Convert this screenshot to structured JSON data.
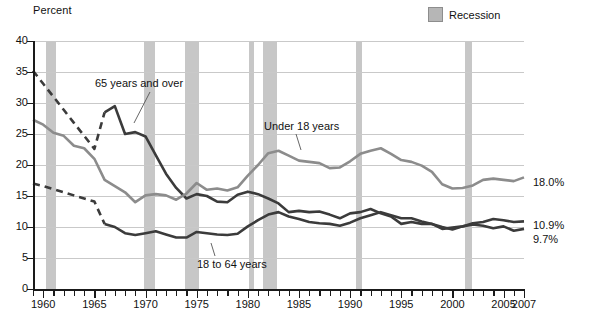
{
  "axis_title": "Percent",
  "legend": {
    "label": "Recession",
    "swatch_color": "#b6b6b6"
  },
  "right_labels": [
    {
      "text": "18.0%",
      "series": "Under 18 years"
    },
    {
      "text": "10.9%",
      "series": "18 to 64 years"
    },
    {
      "text": "9.7%",
      "series": "65 years and over"
    }
  ],
  "annotations": [
    {
      "text": "65 years and over"
    },
    {
      "text": "Under 18 years"
    },
    {
      "text": "18 to 64 years"
    }
  ],
  "source_note": "",
  "chart_data": {
    "type": "line",
    "title": "",
    "xlabel": "",
    "ylabel": "Percent",
    "xlim": [
      1959,
      2007
    ],
    "ylim": [
      0,
      40
    ],
    "ytick_values": [
      0,
      5,
      10,
      15,
      20,
      25,
      30,
      35,
      40
    ],
    "ytick_labels": [
      "0",
      "5",
      "10",
      "15",
      "20",
      "25",
      "30",
      "35",
      "40"
    ],
    "xtick_major_values": [
      1960,
      1965,
      1970,
      1975,
      1980,
      1985,
      1990,
      1995,
      2000,
      2005,
      2007
    ],
    "xtick_major_labels": [
      "1960",
      "1965",
      "1970",
      "1975",
      "1980",
      "1985",
      "1990",
      "1995",
      "2000",
      "2005",
      "2007"
    ],
    "xtick_minor_step": 1,
    "grid": "horizontal",
    "legend_position": "top-right",
    "recession_bands": [
      {
        "start": 1960.3,
        "end": 1961.2
      },
      {
        "start": 1969.9,
        "end": 1970.9
      },
      {
        "start": 1973.9,
        "end": 1975.2
      },
      {
        "start": 1980.1,
        "end": 1980.6
      },
      {
        "start": 1981.5,
        "end": 1982.9
      },
      {
        "start": 1990.6,
        "end": 1991.2
      },
      {
        "start": 2001.2,
        "end": 2001.9
      }
    ],
    "series": [
      {
        "name": "65 years and over",
        "color": "#3b3b3b",
        "width": 2.6,
        "dashed_until": 1966,
        "x": [
          1959,
          1960,
          1961,
          1962,
          1963,
          1964,
          1965,
          1966,
          1967,
          1968,
          1969,
          1970,
          1971,
          1972,
          1973,
          1974,
          1975,
          1976,
          1977,
          1978,
          1979,
          1980,
          1981,
          1982,
          1983,
          1984,
          1985,
          1986,
          1987,
          1988,
          1989,
          1990,
          1991,
          1992,
          1993,
          1994,
          1995,
          1996,
          1997,
          1998,
          1999,
          2000,
          2001,
          2002,
          2003,
          2004,
          2005,
          2006,
          2007
        ],
        "y": [
          35.2,
          33.1,
          31.0,
          28.9,
          26.8,
          24.7,
          22.6,
          28.5,
          29.5,
          25.0,
          25.3,
          24.6,
          21.6,
          18.6,
          16.3,
          14.6,
          15.3,
          15.0,
          14.1,
          14.0,
          15.2,
          15.7,
          15.3,
          14.6,
          13.8,
          12.4,
          12.6,
          12.4,
          12.5,
          12.0,
          11.4,
          12.2,
          12.4,
          12.9,
          12.2,
          11.7,
          10.5,
          10.8,
          10.5,
          10.5,
          9.7,
          9.9,
          10.1,
          10.4,
          10.2,
          9.8,
          10.1,
          9.4,
          9.7
        ]
      },
      {
        "name": "18 to 64 years",
        "color": "#3b3b3b",
        "width": 2.6,
        "dashed_until": 1966,
        "x": [
          1959,
          1960,
          1961,
          1962,
          1963,
          1964,
          1965,
          1966,
          1967,
          1968,
          1969,
          1970,
          1971,
          1972,
          1973,
          1974,
          1975,
          1976,
          1977,
          1978,
          1979,
          1980,
          1981,
          1982,
          1983,
          1984,
          1985,
          1986,
          1987,
          1988,
          1989,
          1990,
          1991,
          1992,
          1993,
          1994,
          1995,
          1996,
          1997,
          1998,
          1999,
          2000,
          2001,
          2002,
          2003,
          2004,
          2005,
          2006,
          2007
        ],
        "y": [
          17.0,
          16.6,
          16.1,
          15.6,
          15.1,
          14.6,
          14.1,
          10.5,
          10.0,
          9.0,
          8.7,
          9.0,
          9.3,
          8.8,
          8.3,
          8.3,
          9.2,
          9.0,
          8.8,
          8.7,
          8.9,
          10.1,
          11.1,
          12.0,
          12.4,
          11.7,
          11.3,
          10.8,
          10.6,
          10.5,
          10.2,
          10.7,
          11.4,
          11.9,
          12.4,
          11.9,
          11.4,
          11.4,
          10.9,
          10.5,
          10.0,
          9.6,
          10.1,
          10.6,
          10.8,
          11.3,
          11.1,
          10.8,
          10.9
        ]
      },
      {
        "name": "Under 18 years",
        "color": "#8c8c8c",
        "width": 2.6,
        "dashed_until": null,
        "x": [
          1959,
          1960,
          1961,
          1962,
          1963,
          1964,
          1965,
          1966,
          1967,
          1968,
          1969,
          1970,
          1971,
          1972,
          1973,
          1974,
          1975,
          1976,
          1977,
          1978,
          1979,
          1980,
          1981,
          1982,
          1983,
          1984,
          1985,
          1986,
          1987,
          1988,
          1989,
          1990,
          1991,
          1992,
          1993,
          1994,
          1995,
          1996,
          1997,
          1998,
          1999,
          2000,
          2001,
          2002,
          2003,
          2004,
          2005,
          2006,
          2007
        ],
        "y": [
          27.3,
          26.5,
          25.2,
          24.7,
          23.1,
          22.7,
          21.0,
          17.6,
          16.6,
          15.6,
          14.0,
          15.1,
          15.3,
          15.1,
          14.4,
          15.4,
          17.1,
          16.0,
          16.2,
          15.9,
          16.4,
          18.3,
          20.0,
          21.9,
          22.3,
          21.5,
          20.7,
          20.5,
          20.3,
          19.5,
          19.6,
          20.6,
          21.8,
          22.3,
          22.7,
          21.8,
          20.8,
          20.5,
          19.9,
          18.9,
          16.9,
          16.2,
          16.3,
          16.7,
          17.6,
          17.8,
          17.6,
          17.4,
          18.0
        ]
      }
    ]
  }
}
